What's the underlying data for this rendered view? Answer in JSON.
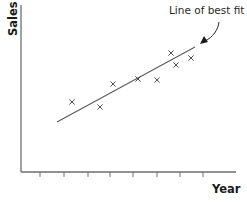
{
  "chart_data": {
    "type": "scatter",
    "title": "",
    "xlabel": "Year",
    "ylabel": "Sales",
    "x_ticks": 8,
    "x_tick_labels": [],
    "y_tick_labels": [],
    "grid": false,
    "legend": null,
    "annotation": "Line of best fit",
    "series": [
      {
        "name": "Sales data",
        "marker": "x",
        "points": [
          {
            "x": 2.2,
            "y": 4.2
          },
          {
            "x": 3.4,
            "y": 3.8
          },
          {
            "x": 4.0,
            "y": 5.3
          },
          {
            "x": 5.0,
            "y": 5.7
          },
          {
            "x": 5.8,
            "y": 5.6
          },
          {
            "x": 6.4,
            "y": 7.3
          },
          {
            "x": 6.7,
            "y": 6.5
          },
          {
            "x": 7.3,
            "y": 6.9
          }
        ]
      }
    ],
    "best_fit_line": {
      "x0": 1.5,
      "y0": 3.1,
      "x1": 7.5,
      "y1": 7.8
    }
  },
  "labels": {
    "x_axis": "Year",
    "y_axis": "Sales",
    "annotation": "Line of best fit"
  },
  "plot": {
    "origin_px": [
      21,
      172
    ],
    "x_end_px": 236,
    "y_end_px": 5,
    "tick_px": [
      40,
      64,
      88,
      110,
      133,
      157,
      180,
      203
    ],
    "tick_len": 5,
    "points_px": [
      [
        72,
        102
      ],
      [
        100,
        107
      ],
      [
        113,
        84
      ],
      [
        138,
        79
      ],
      [
        157,
        80
      ],
      [
        171,
        53
      ],
      [
        176,
        65
      ],
      [
        191,
        58
      ]
    ],
    "fit_px": [
      [
        57,
        122
      ],
      [
        195,
        47
      ]
    ],
    "arrow_path": "M219,22 C218,30 213,37 205,41",
    "arrowhead_pts": "200,44 208,42 204,36"
  },
  "colors": {
    "axis": "#6e6e6e",
    "marker": "#3c3c3c",
    "text": "#1a1a1a"
  }
}
